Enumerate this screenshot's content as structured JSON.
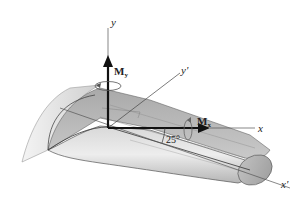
{
  "diagram": {
    "type": "3D wing cross-section with coordinate axes and moment vectors",
    "axes": {
      "y": "y",
      "y_prime": "y'",
      "x": "x",
      "x_prime": "x'"
    },
    "moments": {
      "My": {
        "symbol": "M",
        "subscript": "y"
      },
      "Mx": {
        "symbol": "M",
        "subscript": "x"
      }
    },
    "angle_label": "25°",
    "colors": {
      "wing_light": "#e6e6e6",
      "wing_mid": "#b8b8b8",
      "wing_dark": "#8e8e8e",
      "axis_line": "#555555",
      "vector": "#111111"
    }
  }
}
